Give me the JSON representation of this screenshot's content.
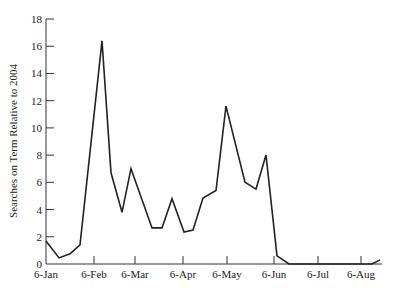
{
  "chart_data": {
    "type": "line",
    "title": "",
    "xlabel": "",
    "ylabel": "Searches on Term Relative to 2004",
    "ylim": [
      0,
      18
    ],
    "yticks": [
      0,
      2,
      4,
      6,
      8,
      10,
      12,
      14,
      16,
      18
    ],
    "xticks": [
      "6-Jan",
      "6-Feb",
      "6-Mar",
      "6-Apr",
      "6-May",
      "6-Jun",
      "6-Jul",
      "6-Aug"
    ],
    "grid": false,
    "legend": null,
    "series": [
      {
        "name": "Searches",
        "points": [
          {
            "x": "6-Jan",
            "y": 1.7
          },
          {
            "x": "14-Jan",
            "y": 0.45
          },
          {
            "x": "21-Jan",
            "y": 0.75
          },
          {
            "x": "28-Jan",
            "y": 1.4
          },
          {
            "x": "11-Feb",
            "y": 16.4
          },
          {
            "x": "17-Feb",
            "y": 6.7
          },
          {
            "x": "24-Feb",
            "y": 3.8
          },
          {
            "x": "2-Mar",
            "y": 7.0
          },
          {
            "x": "16-Mar",
            "y": 2.65
          },
          {
            "x": "23-Mar",
            "y": 2.65
          },
          {
            "x": "30-Mar",
            "y": 4.8
          },
          {
            "x": "6-Apr",
            "y": 2.35
          },
          {
            "x": "13-Apr",
            "y": 2.5
          },
          {
            "x": "20-Apr",
            "y": 4.85
          },
          {
            "x": "28-Apr",
            "y": 5.4
          },
          {
            "x": "4-May",
            "y": 11.6
          },
          {
            "x": "17-May",
            "y": 6.0
          },
          {
            "x": "24-May",
            "y": 5.5
          },
          {
            "x": "31-May",
            "y": 8.0
          },
          {
            "x": "8-Jun",
            "y": 0.6
          },
          {
            "x": "15-Jun",
            "y": 0.0
          },
          {
            "x": "9-Aug",
            "y": 0.0
          },
          {
            "x": "14-Aug",
            "y": 0.3
          }
        ]
      }
    ]
  },
  "layout": {
    "plot": {
      "x0": 46,
      "y0": 264,
      "ytop": 19,
      "pxPerUnit": 13.61
    },
    "xtick_px": [
      46,
      94,
      135,
      183,
      227,
      274,
      318,
      361
    ],
    "point_px_x": [
      46,
      59,
      70,
      80,
      102,
      111,
      122,
      131,
      152,
      162,
      172,
      184,
      193,
      203,
      216,
      226,
      245,
      256,
      266,
      277,
      289,
      372,
      380
    ],
    "line_color": "#222222"
  }
}
